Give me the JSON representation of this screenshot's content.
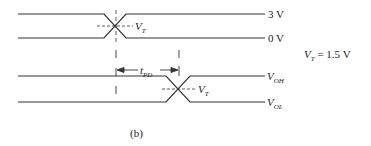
{
  "diagram": {
    "caption": "(b)",
    "input": {
      "high_label": "3 V",
      "low_label": "0 V",
      "threshold_label": "V",
      "threshold_sub": "T"
    },
    "output": {
      "high_label": "V",
      "high_sub": "OH",
      "low_label": "V",
      "low_sub": "OL",
      "threshold_label": "V",
      "threshold_sub": "T"
    },
    "delay": {
      "label": "t",
      "sub": "PD"
    },
    "equation": {
      "lhs": "V",
      "lhs_sub": "T",
      "rhs": " = 1.5 V"
    }
  }
}
